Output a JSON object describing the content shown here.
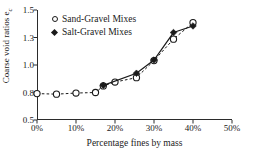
{
  "chart_data": {
    "type": "scatter",
    "title": "",
    "xlabel": "Percentage fines by mass",
    "ylabel": "Coarse void ratios e",
    "ylabel_subscript": "c",
    "xlim": [
      0,
      50
    ],
    "ylim": [
      0.5,
      1.5
    ],
    "grid": false,
    "legend_position": "top-left",
    "x_tick_labels": [
      "0%",
      "10%",
      "20%",
      "30%",
      "40%",
      "50%"
    ],
    "x_tick_values": [
      0,
      10,
      20,
      30,
      40,
      50
    ],
    "y_tick_labels": [
      "0.5",
      "0.8",
      "1.0",
      "1.3",
      "1.5"
    ],
    "y_tick_values": [
      0.5,
      0.75,
      1.0,
      1.25,
      1.5
    ],
    "series": [
      {
        "name": "Sand-Gravel Mixes",
        "marker": "open-circle",
        "line_style": "dashed",
        "color": "#1a1a1a",
        "x": [
          0,
          5,
          10,
          15,
          17,
          20,
          25.5,
          30,
          35,
          40
        ],
        "y": [
          0.74,
          0.735,
          0.745,
          0.75,
          0.81,
          0.845,
          0.885,
          1.04,
          1.235,
          1.385
        ]
      },
      {
        "name": "Salt-Gravel Mixes",
        "marker": "filled-diamond",
        "line_style": "solid",
        "color": "#1a1a1a",
        "x": [
          17,
          25.5,
          30,
          35,
          40
        ],
        "y": [
          0.815,
          0.925,
          1.045,
          1.295,
          1.355
        ]
      }
    ]
  },
  "legend": {
    "items": [
      {
        "label": "Sand-Gravel Mixes",
        "marker": "open-circle"
      },
      {
        "label": "Salt-Gravel Mixes",
        "marker": "filled-diamond"
      }
    ]
  }
}
